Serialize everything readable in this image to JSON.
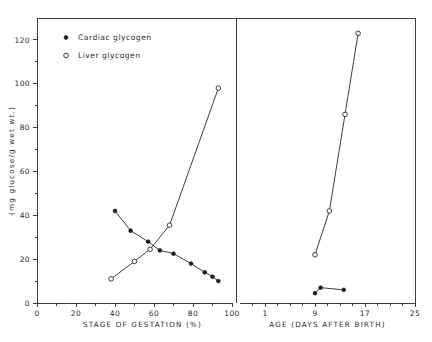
{
  "chart_data": {
    "type": "line",
    "title": "",
    "ylabel": "(mg glucose/g wet wt.)",
    "ylim": [
      0,
      130
    ],
    "yticks": [
      0,
      20,
      40,
      60,
      80,
      100,
      120
    ],
    "ytick_labels": [
      "0",
      "20",
      "40",
      "60",
      "80",
      "100",
      "120"
    ],
    "grid": false,
    "legend_position": "top-left",
    "legend": [
      {
        "label": "Cardiac glycogen",
        "marker": "filled-circle",
        "color": "#111111"
      },
      {
        "label": "Liver glycogen",
        "marker": "open-circle",
        "color": "#111111"
      }
    ],
    "panels": [
      {
        "name": "gestation",
        "xlabel": "STAGE OF GESTATION (%)",
        "xlim": [
          0,
          100
        ],
        "xticks": [
          0,
          20,
          40,
          60,
          80,
          100
        ],
        "xtick_labels": [
          "0",
          "20",
          "40",
          "60",
          "80",
          "100"
        ],
        "minor_xticks": [
          10,
          30,
          50,
          70,
          90
        ],
        "series": [
          {
            "name": "Cardiac glycogen",
            "marker": "filled-circle",
            "x": [
              40,
              48,
              57,
              63,
              70,
              79,
              86,
              90,
              93
            ],
            "y": [
              42,
              33,
              28,
              24,
              22.5,
              18,
              14,
              12,
              10
            ]
          },
          {
            "name": "Liver glycogen",
            "marker": "open-circle",
            "x": [
              38,
              50,
              58,
              68,
              93
            ],
            "y": [
              11,
              19,
              24.5,
              35.5,
              98
            ]
          }
        ]
      },
      {
        "name": "postnatal",
        "xlabel": "AGE (DAYS AFTER BIRTH)",
        "xlim": [
          -3,
          25
        ],
        "xticks": [
          1,
          9,
          17,
          25
        ],
        "xtick_labels": [
          "1",
          "9",
          "17",
          "25"
        ],
        "minor_xticks": [
          -1,
          3,
          5,
          7,
          11,
          13,
          15,
          19,
          21,
          23
        ],
        "series": [
          {
            "name": "Liver glycogen",
            "marker": "open-circle",
            "x": [
              9.0,
              11.3,
              13.8,
              15.9
            ],
            "y": [
              22,
              42,
              86,
              123
            ]
          },
          {
            "name": "Cardiac glycogen",
            "marker": "filled-circle",
            "x": [
              9.0,
              9.9,
              13.6
            ],
            "y": [
              4.5,
              7.0,
              6.0
            ]
          }
        ]
      }
    ]
  }
}
